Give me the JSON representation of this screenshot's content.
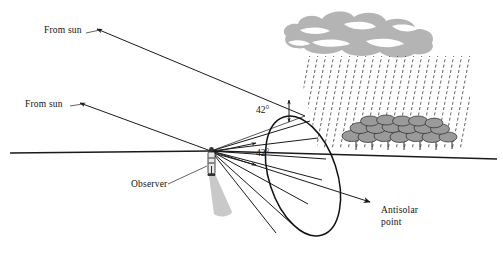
{
  "figure": {
    "labels": {
      "from_sun_upper": "From sun",
      "from_sun_lower": "From sun",
      "angle_upper": "42°",
      "angle_lower": "42°",
      "observer": "Observer",
      "antisolar_line1": "Antisolar",
      "antisolar_line2": "point"
    },
    "colors": {
      "ink": "#1a1a1a",
      "cloud": "#b4b4b4",
      "foliage": "#9a9a9a",
      "shadow": "#c9c9c9",
      "background": "#ffffff"
    },
    "elements": {
      "horizon_name": "horizon-line",
      "cone_name": "rainbow-cone",
      "ellipse_name": "rainbow-circle-ellipse",
      "cloud_name": "rain-cloud",
      "rain_name": "rain-shaft",
      "trees_name": "tree-line",
      "observer_name": "observer-figure",
      "shadow_name": "observer-shadow",
      "antisolar_axis_name": "antisolar-axis-arrow"
    },
    "geometry": {
      "angle_degrees": 42,
      "observer_x": 211,
      "observer_eye_y": 151,
      "horizon_y": 152,
      "antisolar_arrow_end_x": 372,
      "antisolar_arrow_end_y": 203
    }
  }
}
